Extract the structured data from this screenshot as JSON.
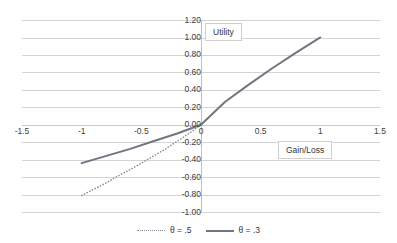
{
  "chart_data": {
    "type": "line",
    "title": "",
    "xlabel": "Gain/Loss",
    "ylabel": "Utility",
    "xlim": [
      -1.5,
      1.5
    ],
    "ylim": [
      -1.0,
      1.2
    ],
    "grid": true,
    "legend_position": "bottom",
    "x_ticks": [
      "-1.5",
      "-1",
      "-0.5",
      "0",
      "0.5",
      "1",
      "1.5"
    ],
    "x_tick_values": [
      -1.5,
      -1,
      -0.5,
      0,
      0.5,
      1,
      1.5
    ],
    "y_ticks": [
      "1.20",
      "1.00",
      "0.80",
      "0.60",
      "0.40",
      "0.20",
      "0.00",
      "-0.20",
      "-0.40",
      "-0.60",
      "-0.80",
      "-1.00"
    ],
    "y_tick_values": [
      1.2,
      1.0,
      0.8,
      0.6,
      0.4,
      0.2,
      0.0,
      -0.2,
      -0.4,
      -0.6,
      -0.8,
      -1.0
    ],
    "series": [
      {
        "name": "θ = .5",
        "style": "dotted",
        "color": "#8a8f99",
        "x": [
          -1.0,
          -0.9,
          -0.8,
          -0.7,
          -0.6,
          -0.5,
          -0.4,
          -0.3,
          -0.2,
          -0.1,
          0.0
        ],
        "values": [
          -0.81,
          -0.74,
          -0.67,
          -0.59,
          -0.52,
          -0.44,
          -0.36,
          -0.28,
          -0.19,
          -0.1,
          0.0
        ]
      },
      {
        "name": "θ = .3",
        "style": "solid",
        "color": "#6f7680",
        "x": [
          -1.0,
          -0.8,
          -0.6,
          -0.4,
          -0.2,
          0.0,
          0.2,
          0.4,
          0.6,
          0.8,
          1.0
        ],
        "values": [
          -0.44,
          -0.36,
          -0.28,
          -0.19,
          -0.1,
          0.0,
          0.26,
          0.46,
          0.65,
          0.83,
          1.0
        ]
      }
    ],
    "legend": [
      {
        "label": "θ = .5",
        "style": "dotted",
        "color": "#8a8f99"
      },
      {
        "label": "θ = .3",
        "style": "solid",
        "color": "#6f7680"
      }
    ],
    "colors": {
      "gridline": "#d4d4d4",
      "axis": "#bfbfbf",
      "text": "#404040",
      "background": "#ffffff",
      "series_solid": "#6f7680",
      "series_dotted": "#8a8f99"
    }
  }
}
